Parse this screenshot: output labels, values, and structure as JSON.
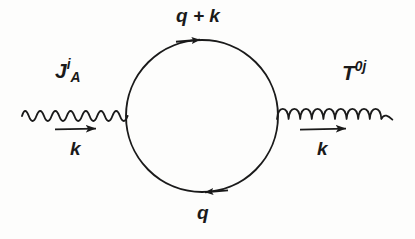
{
  "figure": {
    "type": "feynman-diagram",
    "background_color": "#fdfdfc",
    "ink_color": "#1a1a1a"
  },
  "labels": {
    "left_vertex_operator": {
      "base": "J",
      "subscript": "A",
      "superscript": "i",
      "full": "J_A^i"
    },
    "right_vertex_operator": {
      "base": "T",
      "superscript": "0j",
      "full": "T^0j"
    },
    "loop_top_momentum": "q + k",
    "loop_bottom_momentum": "q",
    "incoming_momentum": "k",
    "outgoing_momentum": "k"
  },
  "lines": {
    "photon": {
      "name": "wavy-photon-line",
      "style": "wavy",
      "direction": "incoming-left",
      "x_start": 22,
      "x_end": 128,
      "y": 116,
      "amplitude": 8,
      "oscillations": 9
    },
    "gluon": {
      "name": "gluon-coil-line",
      "style": "coil",
      "direction": "outgoing-right",
      "x_start": 277,
      "x_end": 393,
      "y": 118,
      "loops": 11,
      "loop_height": 13
    },
    "loop": {
      "name": "fermion-loop-circle",
      "center_x": 202,
      "center_y": 116,
      "radius": 76
    }
  },
  "arrows": {
    "loop_top": {
      "direction": "right",
      "x": 200,
      "y": 40
    },
    "loop_bottom": {
      "direction": "left",
      "x": 204,
      "y": 192
    },
    "momentum_left": {
      "direction": "right",
      "x_start": 55,
      "x_end": 99,
      "y": 129
    },
    "momentum_right": {
      "direction": "right",
      "x_start": 300,
      "x_end": 349,
      "y": 129
    }
  }
}
